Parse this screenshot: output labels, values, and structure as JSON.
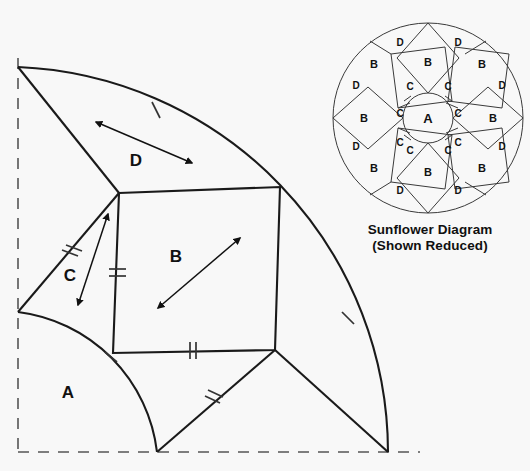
{
  "figure": {
    "background_color": "#f8f8f8",
    "line_color": "#1a1a1a",
    "label_color": "#111111"
  },
  "main_block": {
    "name": "quarter-block-template",
    "pieces": [
      {
        "id": "A",
        "label": "A",
        "label_x": 68,
        "label_y": 398,
        "font_size": 17
      },
      {
        "id": "B",
        "label": "B",
        "label_x": 176,
        "label_y": 262,
        "font_size": 17
      },
      {
        "id": "C",
        "label": "C",
        "label_x": 70,
        "label_y": 281,
        "font_size": 17
      },
      {
        "id": "D",
        "label": "D",
        "label_x": 136,
        "label_y": 166,
        "font_size": 17
      }
    ],
    "guide_lines": {
      "vertical_dashed": {
        "x": 18,
        "y1": 58,
        "y2": 453
      },
      "horizontal_dashed": {
        "y": 452,
        "x1": 18,
        "x2": 420
      }
    },
    "outer_arc": {
      "center_x": 18,
      "center_y": 67,
      "radius": 386
    },
    "inner_arc": {
      "center_x": 18,
      "center_y": 67,
      "radius": 140
    },
    "vertices": {
      "origin": [
        18,
        67
      ],
      "arc_top": [
        18,
        67
      ],
      "arc_bottom": [
        388,
        452
      ],
      "inner_arc_left": [
        18,
        312
      ],
      "inner_arc_bottom": [
        157,
        452
      ],
      "square_top_left": [
        119,
        193
      ],
      "square_top_right": [
        280,
        187
      ],
      "square_bottom_right": [
        275,
        350
      ],
      "square_bottom_left": [
        113,
        353
      ]
    },
    "tick_marks": [
      {
        "name": "tick-single-d-arc",
        "count": 1,
        "x": 155,
        "y": 110
      },
      {
        "name": "tick-double-c-edge",
        "count": 2,
        "x": 70,
        "y": 253
      },
      {
        "name": "tick-double-b-left",
        "count": 2,
        "x": 117,
        "y": 273
      },
      {
        "name": "tick-double-b-bottom",
        "count": 2,
        "x": 192,
        "y": 350
      },
      {
        "name": "tick-double-lower-diagonal",
        "count": 2,
        "x": 212,
        "y": 399
      },
      {
        "name": "tick-single-outer-arc",
        "count": 1,
        "x": 348,
        "y": 318
      },
      {
        "name": "tick-single-inner-arc",
        "count": 1,
        "x": 110,
        "y": 357
      }
    ],
    "grain_arrows": [
      {
        "name": "grain-arrow-d",
        "x1": 96,
        "y1": 122,
        "x2": 192,
        "y2": 163,
        "double_headed": true
      },
      {
        "name": "grain-arrow-b",
        "x1": 158,
        "y1": 308,
        "x2": 240,
        "y2": 238,
        "double_headed": true
      },
      {
        "name": "grain-arrow-c",
        "x1": 106,
        "y1": 218,
        "x2": 78,
        "y2": 305,
        "double_headed": true
      }
    ]
  },
  "sunflower": {
    "name": "sunflower-diagram",
    "caption_line1": "Sunflower Diagram",
    "caption_line2": "(Shown Reduced)",
    "center_x": 428,
    "center_y": 118,
    "outer_radius": 95,
    "inner_circle_radius": 25,
    "center_label": "A",
    "square_labels": [
      "B",
      "B",
      "B",
      "B",
      "B",
      "B",
      "B",
      "B"
    ],
    "triangle_labels": [
      "C",
      "C",
      "C",
      "C",
      "C",
      "C",
      "C",
      "C"
    ],
    "outer_labels": [
      "D",
      "D",
      "D",
      "D",
      "D",
      "D",
      "D",
      "D"
    ],
    "labels": [
      {
        "text": "A",
        "x": 428,
        "y": 123,
        "size": 13
      },
      {
        "text": "B",
        "x": 428,
        "y": 66,
        "size": 11
      },
      {
        "text": "B",
        "x": 482,
        "y": 68,
        "size": 11
      },
      {
        "text": "B",
        "x": 374,
        "y": 68,
        "size": 11
      },
      {
        "text": "B",
        "x": 493,
        "y": 122,
        "size": 11
      },
      {
        "text": "B",
        "x": 364,
        "y": 122,
        "size": 11
      },
      {
        "text": "B",
        "x": 482,
        "y": 172,
        "size": 11
      },
      {
        "text": "B",
        "x": 374,
        "y": 172,
        "size": 11
      },
      {
        "text": "B",
        "x": 428,
        "y": 176,
        "size": 11
      },
      {
        "text": "C",
        "x": 410,
        "y": 90,
        "size": 10
      },
      {
        "text": "C",
        "x": 448,
        "y": 90,
        "size": 10
      },
      {
        "text": "C",
        "x": 400,
        "y": 117,
        "size": 10
      },
      {
        "text": "C",
        "x": 458,
        "y": 117,
        "size": 10
      },
      {
        "text": "C",
        "x": 400,
        "y": 146,
        "size": 10
      },
      {
        "text": "C",
        "x": 458,
        "y": 146,
        "size": 10
      },
      {
        "text": "C",
        "x": 410,
        "y": 154,
        "size": 10
      },
      {
        "text": "C",
        "x": 448,
        "y": 154,
        "size": 10
      },
      {
        "text": "D",
        "x": 400,
        "y": 46,
        "size": 10
      },
      {
        "text": "D",
        "x": 458,
        "y": 46,
        "size": 10
      },
      {
        "text": "D",
        "x": 356,
        "y": 89,
        "size": 10
      },
      {
        "text": "D",
        "x": 502,
        "y": 89,
        "size": 10
      },
      {
        "text": "D",
        "x": 356,
        "y": 150,
        "size": 10
      },
      {
        "text": "D",
        "x": 502,
        "y": 150,
        "size": 10
      },
      {
        "text": "D",
        "x": 400,
        "y": 194,
        "size": 10
      },
      {
        "text": "D",
        "x": 458,
        "y": 194,
        "size": 10
      }
    ]
  }
}
